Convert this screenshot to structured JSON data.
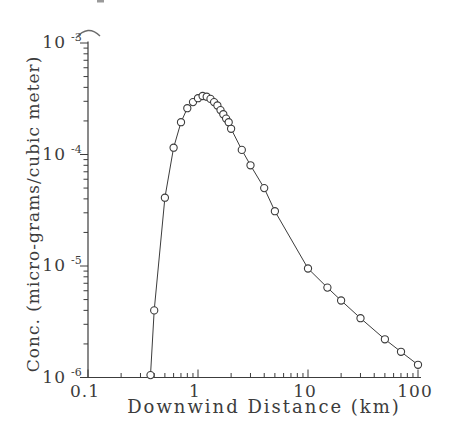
{
  "figure": {
    "width": 453,
    "height": 443,
    "background": "#ffffff",
    "ink_color": "#3c3c3c"
  },
  "chart_data": {
    "type": "line",
    "title": "",
    "xlabel": "Downwind Distance (km)",
    "ylabel": "Conc. (micro-grams/cubic meter)",
    "x_scale": "log",
    "y_scale": "log",
    "xlim": [
      0.1,
      100
    ],
    "ylim": [
      1e-06,
      0.001
    ],
    "grid": false,
    "legend": "none",
    "marker": "open-circle",
    "x_ticks": {
      "values": [
        0.1,
        1,
        10,
        100
      ],
      "labels": [
        "0.1",
        "1",
        "10",
        "100"
      ]
    },
    "y_ticks": {
      "base": "10",
      "exponents": [
        -3,
        -4,
        -5,
        -6
      ]
    },
    "series": [
      {
        "name": "concentration-vs-distance",
        "x": [
          0.37,
          0.4,
          0.5,
          0.6,
          0.7,
          0.8,
          0.9,
          1.0,
          1.1,
          1.2,
          1.3,
          1.4,
          1.5,
          1.6,
          1.7,
          1.8,
          1.9,
          2.0,
          2.5,
          3,
          4,
          5,
          10,
          15,
          20,
          30,
          50,
          70,
          100
        ],
        "y": [
          1.05e-06,
          4e-06,
          4.1e-05,
          0.000115,
          0.000195,
          0.00026,
          0.000295,
          0.00032,
          0.000335,
          0.00033,
          0.000315,
          0.000295,
          0.000275,
          0.00025,
          0.00023,
          0.00021,
          0.000195,
          0.00017,
          0.00011,
          8e-05,
          5e-05,
          3.1e-05,
          9.5e-06,
          6.4e-06,
          4.9e-06,
          3.4e-06,
          2.2e-06,
          1.7e-06,
          1.3e-06
        ]
      }
    ]
  }
}
